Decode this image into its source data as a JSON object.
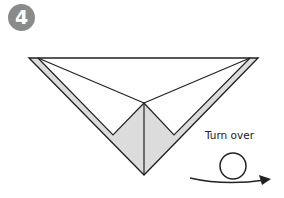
{
  "step": {
    "number": "4",
    "badge_color": "#8a8a8a"
  },
  "instruction": {
    "label": "Turn over",
    "icon": "turn-over-arrow-icon"
  },
  "diagram": {
    "line_color": "#222222",
    "fill_color": "#dcdcdc",
    "paper_color": "#ffffff"
  }
}
